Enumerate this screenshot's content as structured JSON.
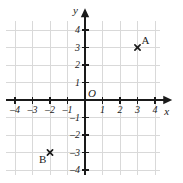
{
  "figure": {
    "kind": "cartesian-coordinate-grid",
    "width": 183,
    "height": 183,
    "background_color": "#ffffff"
  },
  "chart_data": {
    "type": "scatter",
    "title": "",
    "xlabel": "x",
    "ylabel": "y",
    "xlim": [
      -4.5,
      4.3
    ],
    "ylim": [
      -4.3,
      4.5
    ],
    "grid": true,
    "grid_spacing": 1,
    "legend": "none",
    "origin_label": "O",
    "axis_color": "#1a1a1a",
    "grid_color": "#d9d9d9",
    "point_color": "#1a1a1a",
    "x_ticks": [
      -4,
      -3,
      -2,
      -1,
      1,
      2,
      3,
      4
    ],
    "y_ticks": [
      4,
      3,
      2,
      1,
      -1,
      -2,
      -3,
      -4
    ],
    "x_tick_labels": [
      "–4",
      "–3",
      "–2",
      "–1",
      "1",
      "2",
      "3",
      "4"
    ],
    "y_tick_labels": [
      "4",
      "3",
      "2",
      "1",
      "–1",
      "–2",
      "–3",
      "–4"
    ],
    "points": [
      {
        "label": "A",
        "x": 3,
        "y": 3,
        "marker": "x",
        "label_position": "above-right"
      },
      {
        "label": "B",
        "x": -2,
        "y": -3,
        "marker": "x",
        "label_position": "below-left"
      }
    ]
  }
}
